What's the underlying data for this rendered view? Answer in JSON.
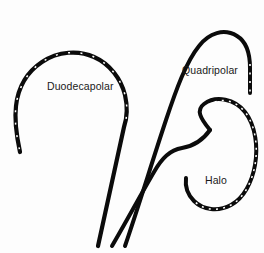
{
  "figure": {
    "background_color": "#fdfdfd",
    "catheter_color": "#000000",
    "electrode_color": "#ffffff",
    "width": 264,
    "height": 253
  },
  "labels": {
    "duodecapolar": "Duodecapolar",
    "quadripolar": "Quadripolar",
    "halo": "Halo"
  },
  "catheters": [
    {
      "id": "duodecapolar",
      "name": "Duodecapolar",
      "electrode_count": 12,
      "shape": "open hook arc with long straight shaft",
      "label": "Duodecapolar"
    },
    {
      "id": "quadripolar",
      "name": "Quadripolar",
      "electrode_count": 4,
      "shape": "inverted J hook with long straight shaft",
      "label": "Quadripolar"
    },
    {
      "id": "halo",
      "name": "Halo",
      "electrode_count": 20,
      "shape": "circular loop with S-curved shaft",
      "label": "Halo"
    }
  ]
}
